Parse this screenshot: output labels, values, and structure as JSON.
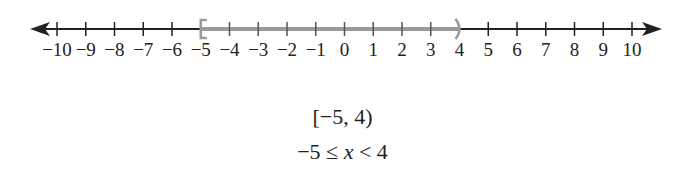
{
  "number_line": {
    "min": -10,
    "max": 10,
    "ticks": [
      -10,
      -9,
      -8,
      -7,
      -6,
      -5,
      -4,
      -3,
      -2,
      -1,
      0,
      1,
      2,
      3,
      4,
      5,
      6,
      7,
      8,
      9,
      10
    ],
    "tick_labels": [
      "−10",
      "−9",
      "−8",
      "−7",
      "−6",
      "−5",
      "−4",
      "−3",
      "−2",
      "−1",
      "0",
      "1",
      "2",
      "3",
      "4",
      "5",
      "6",
      "7",
      "8",
      "9",
      "10"
    ],
    "arrows": "both",
    "shaded_interval": {
      "start": -5,
      "end": 4,
      "left_bracket": "[",
      "right_bracket": ")",
      "color": "#9a9a9a"
    },
    "line_color": "#222222"
  },
  "interval_notation": {
    "open": "[",
    "lower": "−5",
    "sep": ", ",
    "upper": "4",
    "close": ")"
  },
  "inequality": {
    "left": "−5 ≤ ",
    "var": "x",
    "right": " < 4"
  }
}
